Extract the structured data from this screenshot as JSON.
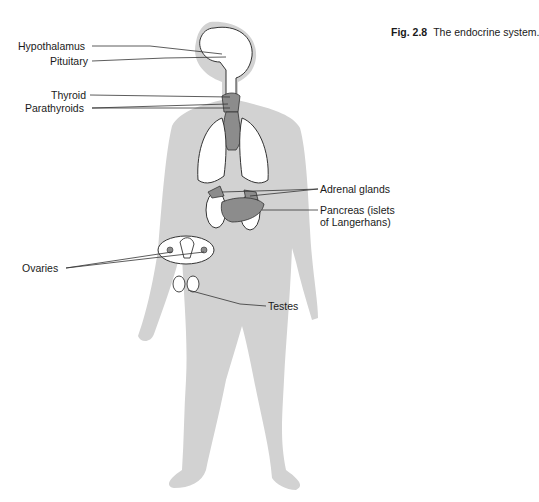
{
  "caption": {
    "number": "Fig. 2.8",
    "title": "The endocrine system."
  },
  "labels": {
    "hypothalamus": "Hypothalamus",
    "pituitary": "Pituitary",
    "thyroid": "Thyroid",
    "parathyroids": "Parathyroids",
    "adrenal": "Adrenal glands",
    "pancreas_1": "Pancreas (islets",
    "pancreas_2": "of Langerhans)",
    "ovaries": "Ovaries",
    "testes": "Testes"
  },
  "colors": {
    "body": "#cfcfcf",
    "organ": "#8c8c8c",
    "outline": "#333333"
  }
}
